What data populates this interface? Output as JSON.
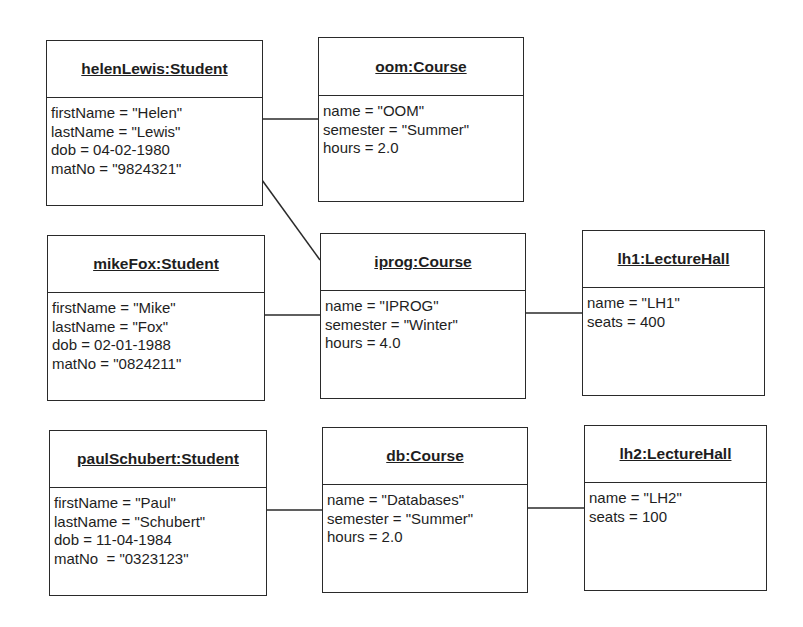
{
  "objects": {
    "helen": {
      "title": "helenLewis:Student",
      "attrs": [
        "firstName = \"Helen\"",
        "lastName = \"Lewis\"",
        "dob = 04-02-1980",
        "matNo = \"9824321\""
      ]
    },
    "oom": {
      "title": "oom:Course",
      "attrs": [
        "name = \"OOM\"",
        "semester = \"Summer\"",
        "hours = 2.0"
      ]
    },
    "mike": {
      "title": "mikeFox:Student",
      "attrs": [
        "firstName = \"Mike\"",
        "lastName = \"Fox\"",
        "dob = 02-01-1988",
        "matNo = \"0824211\""
      ]
    },
    "iprog": {
      "title": "iprog:Course",
      "attrs": [
        "name = \"IPROG\"",
        "semester = \"Winter\"",
        "hours = 4.0"
      ]
    },
    "lh1": {
      "title": "lh1:LectureHall",
      "attrs": [
        "name = \"LH1\"",
        "seats = 400"
      ]
    },
    "paul": {
      "title": "paulSchubert:Student",
      "attrs": [
        "firstName = \"Paul\"",
        "lastName = \"Schubert\"",
        "dob = 11-04-1984",
        "matNo  = \"0323123\""
      ]
    },
    "db": {
      "title": "db:Course",
      "attrs": [
        "name = \"Databases\"",
        "semester = \"Summer\"",
        "hours = 2.0"
      ]
    },
    "lh2": {
      "title": "lh2:LectureHall",
      "attrs": [
        "name = \"LH2\"",
        "seats = 100"
      ]
    }
  },
  "links": [
    {
      "from": "helenLewis:Student",
      "to": "oom:Course"
    },
    {
      "from": "helenLewis:Student",
      "to": "iprog:Course"
    },
    {
      "from": "mikeFox:Student",
      "to": "iprog:Course"
    },
    {
      "from": "iprog:Course",
      "to": "lh1:LectureHall"
    },
    {
      "from": "paulSchubert:Student",
      "to": "db:Course"
    },
    {
      "from": "db:Course",
      "to": "lh2:LectureHall"
    }
  ],
  "colors": {
    "line": "#2a2a2a",
    "background": "#ffffff",
    "text": "#1e1e1e"
  }
}
